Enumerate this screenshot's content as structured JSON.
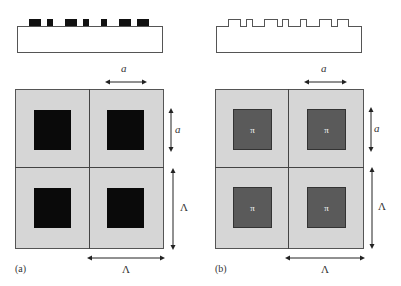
{
  "figure": {
    "panels": [
      {
        "id": "a",
        "label": "(a)",
        "profile_style": "filled",
        "square_style": "black",
        "square_symbol": "",
        "dim_a_top": "a",
        "dim_a_side": "a",
        "dim_period_side": "Λ",
        "dim_period_bottom": "Λ"
      },
      {
        "id": "b",
        "label": "(b)",
        "profile_style": "outline",
        "square_style": "gray",
        "square_symbol": "π",
        "dim_a_top": "a",
        "dim_a_side": "a",
        "dim_period_side": "Λ",
        "dim_period_bottom": "Λ"
      }
    ],
    "colors": {
      "cell_background": "#d6d6d6",
      "square_a": "#0a0a0a",
      "square_b": "#5a5a5a",
      "lines": "#444444"
    }
  }
}
